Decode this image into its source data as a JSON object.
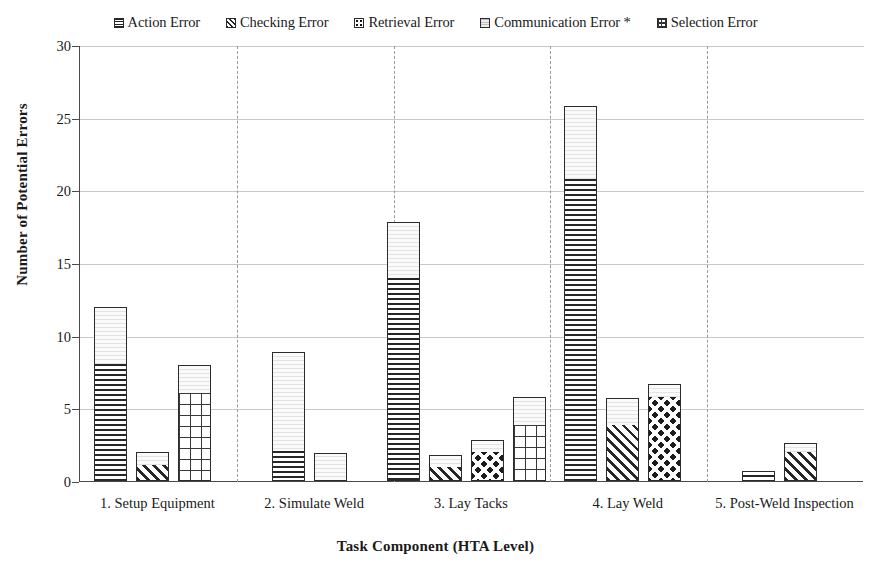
{
  "legend": {
    "position": "top",
    "items": [
      {
        "label": "Action Error",
        "pattern": "horizontal-lines",
        "swatch_class": "sw-hlines"
      },
      {
        "label": "Checking Error",
        "pattern": "diagonal-stripes",
        "swatch_class": "sw-diag"
      },
      {
        "label": "Retrieval Error",
        "pattern": "dots",
        "swatch_class": "sw-dots"
      },
      {
        "label": "Communication Error *",
        "pattern": "light-fill",
        "swatch_class": "sw-light"
      },
      {
        "label": "Selection Error",
        "pattern": "grid",
        "swatch_class": "sw-grid"
      }
    ]
  },
  "axes": {
    "y_ticks": [
      "0",
      "5",
      "10",
      "15",
      "20",
      "25",
      "30"
    ],
    "ylabel": "Number of Potential Errors",
    "xlabel": "Task Component (HTA Level)"
  },
  "chart_data": {
    "type": "bar",
    "title": "",
    "xlabel": "Task Component (HTA Level)",
    "ylabel": "Number of Potential Errors",
    "ylim": [
      0,
      30
    ],
    "ytick_step": 5,
    "grid": true,
    "legend_position": "top",
    "stacked": true,
    "categories": [
      "1. Setup Equipment",
      "2. Simulate Weld",
      "3. Lay Tacks",
      "4. Lay Weld",
      "5. Post-Weld Inspection"
    ],
    "series_names": [
      "Action Error",
      "Checking Error",
      "Retrieval Error",
      "Communication Error *",
      "Selection Error"
    ],
    "groups": [
      {
        "category": "1. Setup Equipment",
        "bars": [
          {
            "base_series": "Action Error",
            "base_value": 8.0,
            "communication_value": 4.0,
            "total": 12.0
          },
          {
            "base_series": "Checking Error",
            "base_value": 1.0,
            "communication_value": 1.0,
            "total": 2.0
          },
          {
            "base_series": "Selection Error",
            "base_value": 6.0,
            "communication_value": 2.0,
            "total": 8.0
          }
        ]
      },
      {
        "category": "2. Simulate Weld",
        "bars": [
          {
            "base_series": "Action Error",
            "base_value": 2.0,
            "communication_value": 6.9,
            "total": 8.9
          },
          {
            "base_series": "Communication Error *",
            "base_value": 0.0,
            "communication_value": 1.9,
            "total": 1.9
          }
        ]
      },
      {
        "category": "3. Lay Tacks",
        "bars": [
          {
            "base_series": "Action Error",
            "base_value": 13.9,
            "communication_value": 3.9,
            "total": 17.8
          },
          {
            "base_series": "Checking Error",
            "base_value": 0.9,
            "communication_value": 0.9,
            "total": 1.8
          },
          {
            "base_series": "Retrieval Error",
            "base_value": 1.9,
            "communication_value": 0.9,
            "total": 2.8
          },
          {
            "base_series": "Selection Error",
            "base_value": 3.8,
            "communication_value": 2.0,
            "total": 5.8
          }
        ]
      },
      {
        "category": "4. Lay Weld",
        "bars": [
          {
            "base_series": "Action Error",
            "base_value": 20.7,
            "communication_value": 5.1,
            "total": 25.8
          },
          {
            "base_series": "Checking Error",
            "base_value": 3.8,
            "communication_value": 1.9,
            "total": 5.7
          },
          {
            "base_series": "Retrieval Error",
            "base_value": 5.7,
            "communication_value": 1.0,
            "total": 6.7
          }
        ]
      },
      {
        "category": "5. Post-Weld Inspection",
        "bars": [
          {
            "base_series": "Action Error",
            "base_value": 0.7,
            "communication_value": 0.0,
            "total": 0.7
          },
          {
            "base_series": "Checking Error",
            "base_value": 1.9,
            "communication_value": 0.7,
            "total": 2.6
          }
        ]
      }
    ]
  }
}
